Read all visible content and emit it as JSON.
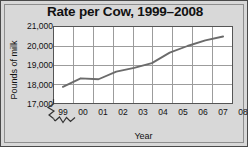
{
  "chart_data": {
    "type": "line",
    "title": "Rate per Cow, 1999–2008",
    "xlabel": "Year",
    "ylabel": "Pounds of milk",
    "categories": [
      "99",
      "00",
      "01",
      "02",
      "03",
      "04",
      "05",
      "06",
      "07",
      "08"
    ],
    "x_full_years": [
      1999,
      2000,
      2001,
      2002,
      2003,
      2004,
      2005,
      2006,
      2007,
      2008
    ],
    "values": [
      17850,
      18300,
      18250,
      18650,
      18850,
      19100,
      19650,
      20000,
      20300,
      20500
    ],
    "series": [
      {
        "name": "Pounds of milk per cow",
        "values": [
          17850,
          18300,
          18250,
          18650,
          18850,
          19100,
          19650,
          20000,
          20300,
          20500
        ]
      }
    ],
    "ylim": [
      17000,
      21000
    ],
    "ytick_labels": [
      "17,000",
      "18,000",
      "19,000",
      "20,000",
      "21,000"
    ],
    "ytick_values": [
      17000,
      18000,
      19000,
      20000,
      21000
    ],
    "grid": true,
    "legend": "none",
    "axis_break": true,
    "line_color": "#6b6b6b",
    "grid_color": "#9a9a9a",
    "axis_color": "#555555",
    "plot_background": "#ffffff",
    "figure_background": "#d8d8d8",
    "text_color": "#111111"
  }
}
